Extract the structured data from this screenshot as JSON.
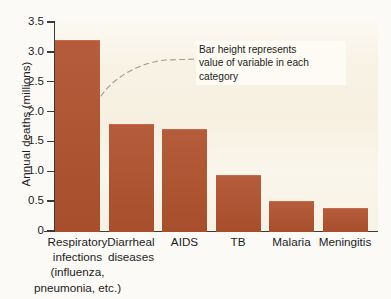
{
  "chart_data": {
    "type": "bar",
    "title": "",
    "xlabel": "",
    "ylabel": "Annual deaths (millions)",
    "categories": [
      "Respiratory infections (influenza, pneumonia, etc.)",
      "Diarrheal diseases",
      "AIDS",
      "TB",
      "Malaria",
      "Meningitis"
    ],
    "category_lines": [
      [
        "Respiratory",
        "infections",
        "(influenza,",
        "pneumonia, etc.)"
      ],
      [
        "Diarrheal",
        "diseases"
      ],
      [
        "AIDS"
      ],
      [
        "TB"
      ],
      [
        "Malaria"
      ],
      [
        "Meningitis"
      ]
    ],
    "values": [
      3.2,
      1.8,
      1.71,
      0.93,
      0.5,
      0.38
    ],
    "ylim": [
      0,
      3.5
    ],
    "ytick_labels": [
      "3.5",
      "3.0",
      "2.5",
      "2.0",
      "1.5",
      "1.0",
      "0.5",
      "0"
    ],
    "ytick_values": [
      3.5,
      3.0,
      2.5,
      2.0,
      1.5,
      1.0,
      0.5,
      0
    ],
    "grid": false,
    "legend": "none",
    "annotations": [
      {
        "lines": [
          "Bar height represents",
          "value of variable in each",
          "category"
        ],
        "target": "top of first bar",
        "connector": "dashed-curve"
      }
    ],
    "colors": {
      "bar": "#b0522f",
      "plot_background": "#f8f2e4",
      "page_background": "#fbfaf7",
      "axis": "#3a3a38",
      "text": "#1d1d1b",
      "annotation_connector": "#9b9b93"
    }
  }
}
